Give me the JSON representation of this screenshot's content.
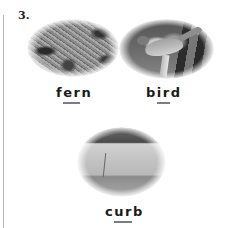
{
  "item": {
    "number": "3."
  },
  "pictures": [
    {
      "subject": "fern",
      "word": {
        "before": "f",
        "highlight": "er",
        "after": "n"
      }
    },
    {
      "subject": "bird",
      "word": {
        "before": "b",
        "highlight": "ir",
        "after": "d"
      }
    },
    {
      "subject": "curb",
      "word": {
        "before": "c",
        "highlight": "ur",
        "after": "b"
      }
    }
  ],
  "colors": {
    "underline": "#7a7a90",
    "text": "#1a1a1a",
    "margin_line": "#b8b8b8"
  }
}
